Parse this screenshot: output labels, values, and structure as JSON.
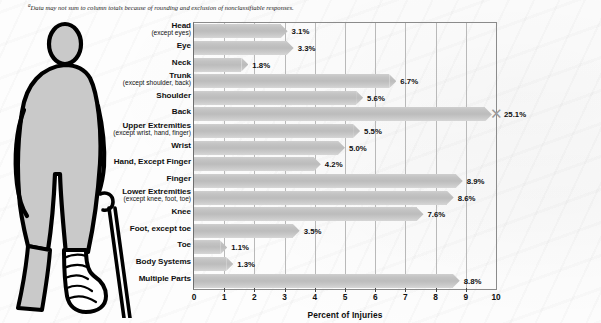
{
  "footnote": {
    "marker": "a",
    "text": "Data may not sum to column totals because of rounding and exclusion of nonclassifiable responses."
  },
  "illustration": {
    "name": "injured-person-with-crutch-and-bandaged-leg",
    "body_fill": "#c9c9c9",
    "outline": "#000000"
  },
  "chart_data": {
    "type": "bar",
    "orientation": "horizontal",
    "title": "",
    "xlabel": "Percent of Injuries",
    "ylabel": "",
    "xlim": [
      0,
      10
    ],
    "xticks": [
      "0",
      "1",
      "2",
      "3",
      "4",
      "5",
      "6",
      "7",
      "8",
      "9",
      "10"
    ],
    "grid": true,
    "bar_color": "#c3c3c3",
    "categories": [
      {
        "main": "Head",
        "sub": "(except eyes)"
      },
      {
        "main": "Eye",
        "sub": ""
      },
      {
        "main": "Neck",
        "sub": ""
      },
      {
        "main": "Trunk",
        "sub": "(except shoulder, back)"
      },
      {
        "main": "Shoulder",
        "sub": ""
      },
      {
        "main": "Back",
        "sub": ""
      },
      {
        "main": "Upper Extremities",
        "sub": "(except wrist, hand, finger)"
      },
      {
        "main": "Wrist",
        "sub": ""
      },
      {
        "main": "Hand, Except Finger",
        "sub": ""
      },
      {
        "main": "Finger",
        "sub": ""
      },
      {
        "main": "Lower Extremities",
        "sub": "(except knee, foot, toe)"
      },
      {
        "main": "Knee",
        "sub": ""
      },
      {
        "main": "Foot, except toe",
        "sub": ""
      },
      {
        "main": "Toe",
        "sub": ""
      },
      {
        "main": "Body Systems",
        "sub": ""
      },
      {
        "main": "Multiple Parts",
        "sub": ""
      }
    ],
    "values": [
      3.1,
      3.3,
      1.8,
      6.7,
      5.6,
      25.1,
      5.5,
      5.0,
      4.2,
      8.9,
      8.6,
      7.6,
      3.5,
      1.1,
      1.3,
      8.8
    ],
    "value_labels": [
      "3.1%",
      "3.3%",
      "1.8%",
      "6.7%",
      "5.6%",
      "25.1%",
      "5.5%",
      "5.0%",
      "4.2%",
      "8.9%",
      "8.6%",
      "7.6%",
      "3.5%",
      "1.1%",
      "1.3%",
      "8.8%"
    ],
    "axis_break": {
      "category": "Back",
      "note": "bar exceeds axis maximum and is drawn with a break marker"
    }
  }
}
